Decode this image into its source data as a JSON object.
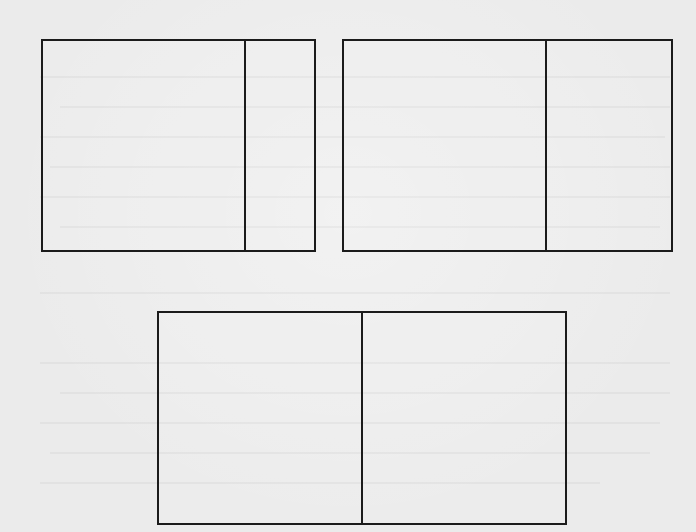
{
  "diagram": {
    "background_color": "#ebebeb",
    "line_color": "#1b1b1b",
    "boxes": [
      {
        "id": "box-1",
        "left": 41,
        "top": 39,
        "right": 316,
        "bottom": 252,
        "divider_x": 244
      },
      {
        "id": "box-2",
        "left": 342,
        "top": 39,
        "right": 673,
        "bottom": 252,
        "divider_x": 545
      },
      {
        "id": "box-3",
        "left": 157,
        "top": 311,
        "right": 567,
        "bottom": 525,
        "divider_x": 361
      }
    ]
  }
}
